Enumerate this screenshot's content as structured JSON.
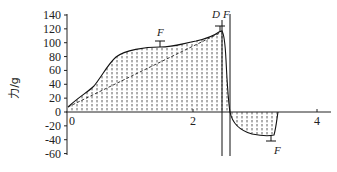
{
  "chart_data": {
    "type": "area",
    "title": "",
    "xlabel": "",
    "ylabel": "力/g",
    "xlim": [
      -0.05,
      4.25
    ],
    "ylim": [
      -60,
      140
    ],
    "x_ticks": [
      0,
      2,
      4
    ],
    "x_tick_labels": [
      "0",
      "2",
      "4"
    ],
    "y_ticks": [
      140,
      120,
      100,
      80,
      60,
      40,
      20,
      0,
      -20,
      -40,
      -60
    ],
    "y_tick_labels": [
      "140",
      "120",
      "100",
      "80",
      "60",
      "40",
      "20",
      "0",
      "-20",
      "-40",
      "-60"
    ],
    "grid": false,
    "series": [
      {
        "name": "force curve (solid, hatched area)",
        "style": "solid",
        "x": [
          0,
          0.2,
          0.4,
          0.55,
          0.7,
          0.9,
          1.1,
          1.3,
          1.5,
          1.7,
          1.9,
          2.1,
          2.3,
          2.45,
          2.5,
          2.53,
          2.56,
          2.6,
          2.65,
          2.7,
          2.8,
          3.0,
          3.2,
          3.3,
          3.35
        ],
        "y": [
          8,
          22,
          38,
          60,
          80,
          88,
          92,
          94,
          96,
          100,
          104,
          108,
          112,
          116,
          118,
          110,
          60,
          5,
          -10,
          -20,
          -28,
          -33,
          -35,
          -34,
          0
        ]
      },
      {
        "name": "linear reference (dashed)",
        "style": "dashed",
        "x": [
          0,
          2.5
        ],
        "y": [
          8,
          118
        ]
      }
    ],
    "vertical_lines": [
      {
        "label": "D",
        "x": 2.47
      },
      {
        "label": "F",
        "x": 2.6
      }
    ],
    "annotations": [
      {
        "text": "F",
        "x": 1.45,
        "y": 112,
        "note": "error bar at ~104"
      },
      {
        "text": "D",
        "x": 2.42,
        "y": 135
      },
      {
        "text": "F",
        "x": 2.55,
        "y": 135
      },
      {
        "text": "F",
        "x": 3.25,
        "y": -58,
        "note": "error bar at ~-40"
      }
    ]
  },
  "axis": {
    "ylabel": "力/g",
    "x_labels": [
      "0",
      "2",
      "4"
    ],
    "y_labels": [
      "140",
      "120",
      "100",
      "80",
      "60",
      "40",
      "20",
      "0",
      "-20",
      "-40",
      "-60"
    ]
  },
  "annotations": {
    "f_upper": "F",
    "d_line": "D",
    "f_line": "F",
    "f_lower": "F"
  }
}
